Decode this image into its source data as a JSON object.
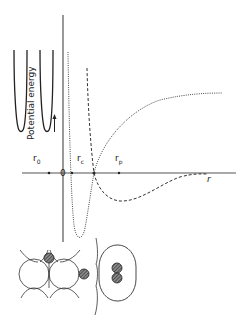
{
  "diagram": {
    "type": "potential-energy-curves",
    "axis": {
      "y_label": "Potential energy",
      "x_label": "r",
      "origin_label": "0"
    },
    "tick_labels": {
      "r0": {
        "base": "r",
        "sub": "0"
      },
      "rc": {
        "base": "r",
        "sub": "c"
      },
      "rp": {
        "base": "r",
        "sub": "p"
      }
    },
    "curves": [
      {
        "name": "chemisorption",
        "style": "dotted",
        "description": "deep narrow well with minimum near r_c"
      },
      {
        "name": "physisorption",
        "style": "dashed",
        "description": "shallow well with minimum near r_p"
      }
    ],
    "insets": {
      "wells": [
        "harmonic-well-1",
        "harmonic-well-2"
      ],
      "atoms": [
        "surface-lattice-with-adatoms",
        "molecule-in-physisorbed-state"
      ]
    },
    "colors": {
      "line": "#222222",
      "axis": "#555555",
      "atom_fill": "#666666"
    }
  }
}
